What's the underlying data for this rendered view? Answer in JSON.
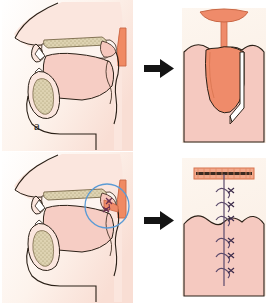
{
  "figure": {
    "background_color": "#ffffff",
    "width": 270,
    "height": 303
  },
  "palette": {
    "panel_bg_cream": "#fbf0e4",
    "panel_bg_white": "#fdfaf6",
    "tissue_pink_light": "#f8cfc6",
    "tissue_pink_mid": "#f3b9ad",
    "tissue_pink_pale": "#fae3dc",
    "flap_salmon": "#ef8b6a",
    "flap_salmon_dark": "#e2714f",
    "pharynx_salmon": "#f08a63",
    "bone_stipple": "#d9cfae",
    "outline_dark": "#2b2017",
    "outline_brown": "#4a372a",
    "suture_purple": "#5b4a6b",
    "suture_knot": "#6a2f4f",
    "circle_blue": "#5b9bd5",
    "arrow_black": "#141414",
    "label_color": "#262626"
  },
  "rows": [
    {
      "id": "row-a",
      "label": "a",
      "label_name": "panel-label-a",
      "caption": "Elevation of superiorly based posterior pharyngeal wall flap",
      "left_panel": {
        "name": "sagittal-view-flap-elevation",
        "view": "midsagittal head and neck",
        "structures": [
          "nasal dorsum",
          "nasal cavity",
          "hard palate with stippled bone",
          "soft palate",
          "tongue",
          "mandible symphysis with stippled bone",
          "posterior pharyngeal wall",
          "incision markings at soft palate"
        ]
      },
      "arrow": {
        "name": "transition-arrow-a",
        "direction": "right",
        "glyph": "→"
      },
      "right_panel": {
        "name": "posterior-view-flap-elevation",
        "view": "intraoral posterior view of soft palate and pharynx",
        "structures": [
          "uvula",
          "soft palate free margin",
          "raised pharyngeal flap",
          "raw donor bed"
        ]
      }
    },
    {
      "id": "row-b",
      "label": "b",
      "label_name": "panel-label-b",
      "caption": "Flap inset and closure with interrupted sutures",
      "left_panel": {
        "name": "sagittal-view-flap-inset",
        "view": "midsagittal head and neck",
        "structures": [
          "nasal cavity",
          "hard palate with stippled bone",
          "soft palate",
          "tongue",
          "mandible",
          "inset pharyngeal flap",
          "suture knots at flap inset"
        ],
        "highlight": {
          "name": "detail-circle-highlight",
          "shape": "circle",
          "color": "#5b9bd5",
          "marks": "suture site"
        }
      },
      "arrow": {
        "name": "transition-arrow-b",
        "direction": "right",
        "glyph": "→"
      },
      "right_panel": {
        "name": "posterior-view-flap-inset",
        "view": "intraoral posterior view after flap inset",
        "donor_site": {
          "name": "donor-site-bar",
          "description": "hatched posterior pharyngeal wall donor defect"
        },
        "suture_count_upper": 3,
        "suture_count_lower": 3,
        "suture_total": 6,
        "structures": [
          "donor site closure bar",
          "midline suture line",
          "interrupted suture knots",
          "soft palate"
        ]
      }
    }
  ]
}
